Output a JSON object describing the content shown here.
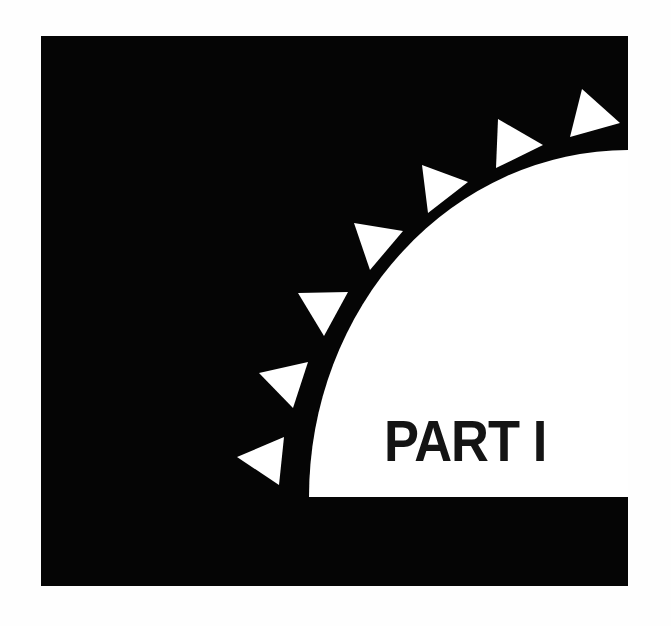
{
  "page": {
    "title": "PART I",
    "background_color": "#ffffff"
  },
  "graphic": {
    "frame_color": "#050505",
    "cutout_color": "#ffffff",
    "triangle_color": "#ffffff",
    "triangle_count": 7,
    "description": "black square panel with a white quarter-ellipse cutout in the lower-right, bordered by a ring of white triangles"
  }
}
